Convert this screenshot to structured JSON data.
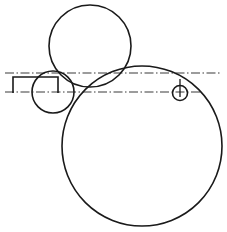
{
  "figure": {
    "width": 227,
    "height": 232,
    "background_color": "#ffffff",
    "stroke_color": "#1a1a1a",
    "centerline_color": "#3a3a3a"
  },
  "chart_data": {
    "type": "diagram",
    "xlabel": "",
    "ylabel": "",
    "xlim": [
      0,
      227
    ],
    "ylim": [
      0,
      232
    ],
    "grid": false,
    "legend": false,
    "shapes": [
      {
        "name": "top-circle",
        "kind": "circle",
        "cx": 90,
        "cy": 46,
        "r": 41,
        "stroke": "#1a1a1a",
        "stroke_width": 1.6,
        "fill": "none"
      },
      {
        "name": "large-circle",
        "kind": "circle",
        "cx": 142,
        "cy": 146,
        "r": 80,
        "stroke": "#1a1a1a",
        "stroke_width": 1.6,
        "fill": "none"
      },
      {
        "name": "small-left-circle",
        "kind": "circle",
        "cx": 53,
        "cy": 92,
        "r": 21,
        "stroke": "#1a1a1a",
        "stroke_width": 1.6,
        "fill": "none"
      },
      {
        "name": "small-right-circle",
        "kind": "circle",
        "cx": 180,
        "cy": 93,
        "r": 7.5,
        "stroke": "#1a1a1a",
        "stroke_width": 1.6,
        "fill": "none"
      },
      {
        "name": "bracket-open-rectangle",
        "kind": "polyline",
        "points": "13,93 13,77 58,77 58,93",
        "stroke": "#1a1a1a",
        "stroke_width": 1.6,
        "fill": "none"
      },
      {
        "name": "upper-centerline",
        "kind": "line",
        "x1": 5,
        "y1": 73,
        "x2": 222,
        "y2": 73,
        "stroke": "#3a3a3a",
        "stroke_width": 1.1,
        "dash": "9,2.5,1.5,2.5"
      },
      {
        "name": "lower-centerline",
        "kind": "line",
        "x1": 5,
        "y1": 92,
        "x2": 200,
        "y2": 92,
        "stroke": "#3a3a3a",
        "stroke_width": 1.1,
        "dash": "9,2.5,1.5,2.5"
      },
      {
        "name": "right-vertical-tick",
        "kind": "line",
        "x1": 180,
        "y1": 79,
        "x2": 180,
        "y2": 97,
        "stroke": "#1a1a1a",
        "stroke_width": 1.3,
        "dash": "none"
      }
    ]
  }
}
